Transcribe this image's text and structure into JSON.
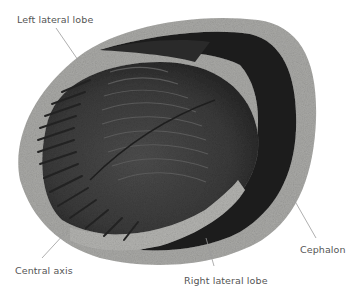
{
  "figure": {
    "labels": [
      {
        "id": "left-lateral-lobe",
        "text": "Left lateral lobe",
        "x": 17,
        "y": 14
      },
      {
        "id": "central-axis",
        "text": "Central axis",
        "x": 15,
        "y": 265
      },
      {
        "id": "right-lateral-lobe",
        "text": "Right lateral lobe",
        "x": 184,
        "y": 275
      },
      {
        "id": "cephalon",
        "text": "Cephalon",
        "x": 300,
        "y": 244
      }
    ],
    "colors": {
      "background": "#ffffff",
      "matrix_rock": "#a9a9a6",
      "matrix_rock_dark": "#8d8d89",
      "body_dark": "#2e2e2e",
      "body_mid": "#474747",
      "leader_line": "#9a9a9a",
      "label_text": "#555555"
    }
  }
}
